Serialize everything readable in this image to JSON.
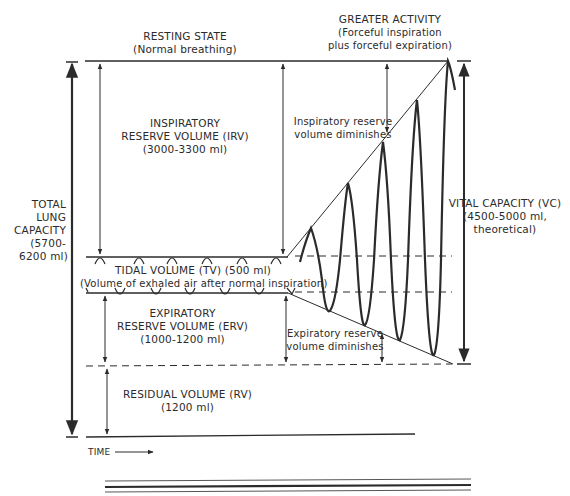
{
  "headers": {
    "resting": {
      "title": "RESTING STATE",
      "subtitle": "(Normal breathing)"
    },
    "activity": {
      "title": "GREATER ACTIVITY",
      "line2": "(Forceful inspiration",
      "line3": "plus forceful expiration)"
    }
  },
  "volumes": {
    "irv": {
      "line1": "INSPIRATORY",
      "line2": "RESERVE VOLUME (IRV)",
      "line3": "(3000-3300 ml)"
    },
    "tv": {
      "line1": "TIDAL VOLUME (TV) (500 ml)",
      "line2": "(Volume of exhaled air after normal inspiration)"
    },
    "erv": {
      "line1": "EXPIRATORY",
      "line2": "RESERVE VOLUME (ERV)",
      "line3": "(1000-1200 ml)"
    },
    "rv": {
      "line1": "RESIDUAL VOLUME (RV)",
      "line2": "(1200 ml)"
    }
  },
  "capacities": {
    "tlc": {
      "line1": "TOTAL",
      "line2": "LUNG",
      "line3": "CAPACITY",
      "line4": "(5700-",
      "line5": "6200 ml)"
    },
    "vc": {
      "line1": "VITAL CAPACITY (VC)",
      "line2": "(4500-5000 ml,",
      "line3": "theoretical)"
    }
  },
  "annotations": {
    "irv_diminishes": {
      "line1": "Inspiratory reserve",
      "line2": "volume diminishes"
    },
    "erv_diminishes": {
      "line1": "Expiratory reserve",
      "line2": "volume diminishes"
    }
  },
  "axis": {
    "time_label": "TIME"
  },
  "colors": {
    "ink": "#2b2b2b",
    "background": "#ffffff"
  }
}
